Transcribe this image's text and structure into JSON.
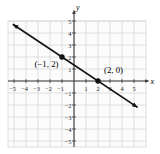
{
  "chart_data": {
    "type": "line",
    "title": "",
    "xlabel": "x",
    "ylabel": "y",
    "xlim": [
      -5,
      5
    ],
    "ylim": [
      -5,
      5
    ],
    "grid": true,
    "x_ticks": [
      -5,
      -4,
      -3,
      -2,
      -1,
      1,
      2,
      3,
      4,
      5
    ],
    "y_ticks": [
      5,
      4,
      3,
      2,
      1,
      -1,
      -2,
      -3,
      -4,
      -5
    ],
    "x_tick_labels": [
      "−5",
      "−4",
      "−3",
      "−2",
      "−1",
      "1",
      "2",
      "3",
      "4",
      "5"
    ],
    "y_tick_labels": [
      "5",
      "4",
      "3",
      "2",
      "1",
      "−1",
      "−2",
      "−3",
      "−4",
      "−5"
    ],
    "series": [
      {
        "name": "line-through-points",
        "slope": -0.6667,
        "y_intercept": 1.3333,
        "draw_from": {
          "x": -5.1,
          "y": 4.73
        },
        "draw_to": {
          "x": 5.3,
          "y": -2.2
        },
        "arrows_both_ends": true
      }
    ],
    "points": [
      {
        "x": -1,
        "y": 2,
        "label": "(−1, 2)"
      },
      {
        "x": 2,
        "y": 0,
        "label": "(2, 0)"
      }
    ],
    "colors": {
      "plot_bg": "#fcfcfc",
      "grid": "#d8d8d8",
      "axis": "#3b3b3b",
      "line": "#111111",
      "point": "#111111",
      "tick_text": "#2a2a2a",
      "label_text": "#1a1a1a"
    }
  }
}
